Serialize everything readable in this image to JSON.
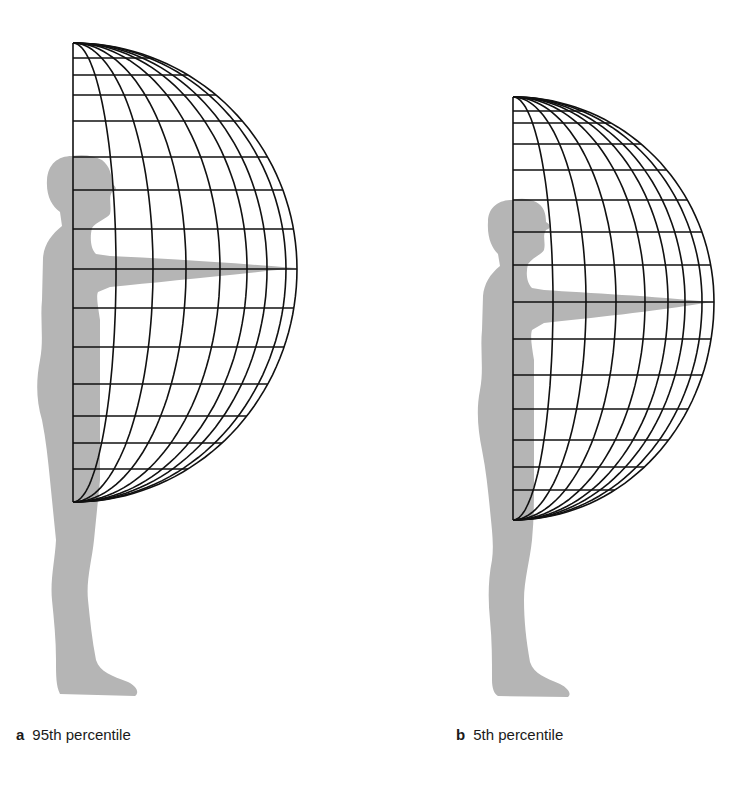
{
  "panels": [
    {
      "id": "a",
      "letter": "a",
      "label": "95th percentile",
      "grid": {
        "left_x": 73,
        "top_y": 43,
        "equator_y": 269,
        "bottom_y": 502,
        "horizontal_lines_y": [
          58,
          75,
          95,
          121,
          157,
          190,
          229,
          269,
          308,
          347,
          384,
          416,
          443,
          469
        ],
        "meridian_equator_x": [
          116,
          153,
          186,
          220,
          247,
          267,
          286,
          297
        ]
      }
    },
    {
      "id": "b",
      "letter": "b",
      "label": "5th percentile",
      "grid": {
        "left_x": 513,
        "top_y": 97,
        "equator_y": 302,
        "bottom_y": 520,
        "horizontal_lines_y": [
          111,
          123,
          144,
          170,
          200,
          232,
          265,
          302,
          339,
          375,
          409,
          440,
          467,
          490
        ],
        "meridian_equator_x": [
          553,
          586,
          616,
          645,
          668,
          685,
          702,
          714
        ]
      }
    }
  ],
  "colors": {
    "silhouette": "#b5b5b5",
    "grid_line": "#111111",
    "background": "#ffffff"
  }
}
